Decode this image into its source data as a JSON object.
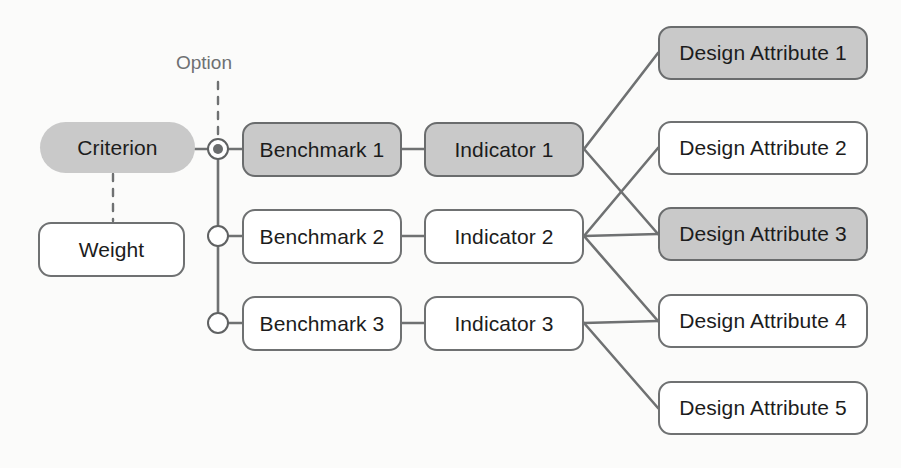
{
  "diagram": {
    "colors": {
      "shaded_fill": "#c9c9c9",
      "plain_fill": "#ffffff",
      "stroke": "#6f7172",
      "text": "#1c1c1c",
      "caption_text": "#6e7072",
      "background": "#fbfbfa"
    },
    "caption": {
      "option_label": "Option"
    },
    "criterion": {
      "label": "Criterion",
      "shaded": true,
      "shape": "pill"
    },
    "weight": {
      "label": "Weight",
      "shaded": false,
      "shape": "rect"
    },
    "options": [
      {
        "name": "option-1",
        "selected": true
      },
      {
        "name": "option-2",
        "selected": false
      },
      {
        "name": "option-3",
        "selected": false
      }
    ],
    "benchmarks": [
      {
        "label": "Benchmark 1",
        "shaded": true
      },
      {
        "label": "Benchmark 2",
        "shaded": false
      },
      {
        "label": "Benchmark 3",
        "shaded": false
      }
    ],
    "indicators": [
      {
        "label": "Indicator 1",
        "shaded": true
      },
      {
        "label": "Indicator 2",
        "shaded": false
      },
      {
        "label": "Indicator 3",
        "shaded": false
      }
    ],
    "design_attributes": [
      {
        "label": "Design Attribute 1",
        "shaded": true
      },
      {
        "label": "Design Attribute 2",
        "shaded": false
      },
      {
        "label": "Design Attribute 3",
        "shaded": true
      },
      {
        "label": "Design Attribute 4",
        "shaded": false
      },
      {
        "label": "Design Attribute 5",
        "shaded": false
      }
    ],
    "connections": [
      {
        "from": "criterion",
        "to": "option-1",
        "style": "solid"
      },
      {
        "from": "criterion",
        "to": "weight",
        "style": "dashed"
      },
      {
        "from": "option-label",
        "to": "option-1",
        "style": "dashed"
      },
      {
        "from": "option-spine",
        "to": "option-1",
        "style": "solid"
      },
      {
        "from": "option-spine",
        "to": "option-2",
        "style": "solid"
      },
      {
        "from": "option-spine",
        "to": "option-3",
        "style": "solid"
      },
      {
        "from": "option-1",
        "to": "Benchmark 1",
        "style": "solid"
      },
      {
        "from": "option-2",
        "to": "Benchmark 2",
        "style": "solid"
      },
      {
        "from": "option-3",
        "to": "Benchmark 3",
        "style": "solid"
      },
      {
        "from": "Benchmark 1",
        "to": "Indicator 1",
        "style": "solid"
      },
      {
        "from": "Benchmark 2",
        "to": "Indicator 2",
        "style": "solid"
      },
      {
        "from": "Benchmark 3",
        "to": "Indicator 3",
        "style": "solid"
      },
      {
        "from": "Indicator 1",
        "to": "Design Attribute 1",
        "style": "solid"
      },
      {
        "from": "Indicator 1",
        "to": "Design Attribute 3",
        "style": "solid"
      },
      {
        "from": "Indicator 2",
        "to": "Design Attribute 2",
        "style": "solid"
      },
      {
        "from": "Indicator 2",
        "to": "Design Attribute 3",
        "style": "solid"
      },
      {
        "from": "Indicator 2",
        "to": "Design Attribute 4",
        "style": "solid"
      },
      {
        "from": "Indicator 3",
        "to": "Design Attribute 4",
        "style": "solid"
      },
      {
        "from": "Indicator 3",
        "to": "Design Attribute 5",
        "style": "solid"
      }
    ]
  }
}
